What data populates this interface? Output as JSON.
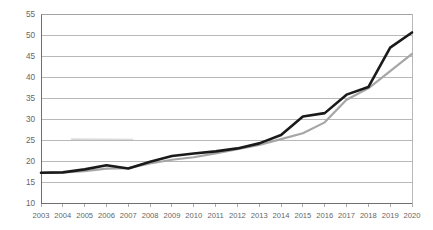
{
  "chart_data": {
    "type": "line",
    "title": "",
    "subtitle": "",
    "xlabel": "",
    "ylabel": "",
    "categories": [
      "2003",
      "2004",
      "2005",
      "2006",
      "2007",
      "2008",
      "2009",
      "2010",
      "2011",
      "2012",
      "2013",
      "2014",
      "2015",
      "2016",
      "2017",
      "2018",
      "2019",
      "2020"
    ],
    "x": [
      2003,
      2004,
      2005,
      2006,
      2007,
      2008,
      2009,
      2010,
      2011,
      2012,
      2013,
      2014,
      2015,
      2016,
      2017,
      2018,
      2019,
      2020
    ],
    "series": [
      {
        "name": "series-1",
        "color": "#1a1a1a",
        "values": [
          17.2,
          17.3,
          18.0,
          19.0,
          18.2,
          19.8,
          21.2,
          21.8,
          22.3,
          23.0,
          24.2,
          26.2,
          30.6,
          31.4,
          35.8,
          37.6,
          47.0,
          50.6
        ]
      },
      {
        "name": "series-2",
        "color": "#a6a6a6",
        "values": [
          17.2,
          17.3,
          17.6,
          18.2,
          18.3,
          19.4,
          20.3,
          20.9,
          21.8,
          22.8,
          23.8,
          25.2,
          26.6,
          29.2,
          34.6,
          37.3,
          41.4,
          45.5
        ]
      }
    ],
    "ylim": [
      10,
      55
    ],
    "yticks": [
      10,
      15,
      20,
      25,
      30,
      35,
      40,
      45,
      50,
      55
    ],
    "ytick_labels": [
      "10",
      "15",
      "20",
      "25",
      "30",
      "35",
      "40",
      "45",
      "50",
      "55"
    ],
    "xlim": [
      2003,
      2020
    ],
    "grid": true,
    "grid_axis": "y",
    "legend": false,
    "legend_position": "none",
    "annotations": [],
    "axis_colors": {
      "grid": "#9a9a9a",
      "axis": "#6e6e6e",
      "text": "#666666"
    },
    "background": "#ffffff"
  },
  "geometry": {
    "plot_left": 41,
    "plot_right": 412,
    "plot_top": 14,
    "plot_bottom": 203
  }
}
